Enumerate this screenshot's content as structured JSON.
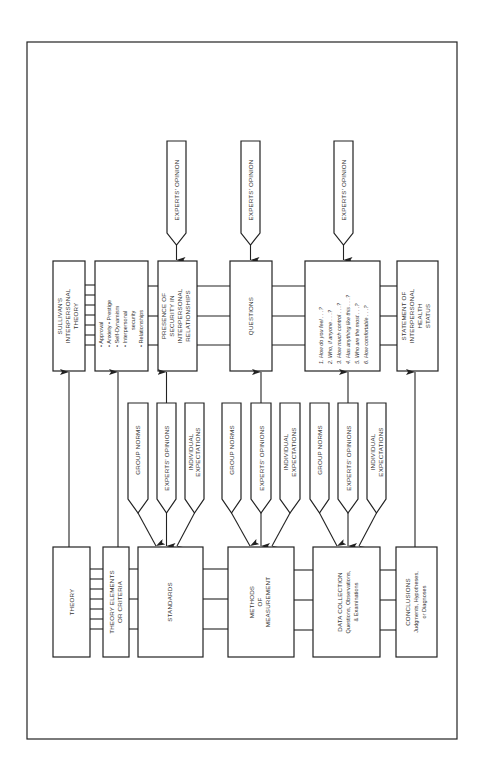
{
  "top_row": {
    "sullivan": [
      "SULLIVAN'S",
      "INTERPERSONAL",
      "THEORY"
    ],
    "bullets": [
      "• Approval",
      "• Anxiety  • Prestige",
      "• Self-Dynamism",
      "• Interpersonal",
      "security",
      "• Relationships"
    ],
    "presence": [
      "PRESENCE OF",
      "SECURITY IN",
      "INTERPERSONAL",
      "RELATIONSHIPS"
    ],
    "questions": "QUESTIONS",
    "question_list": [
      "1.  How do you feel . . .?",
      "2.  Who, if anyone . . .?",
      "3.  How much control . . .?",
      "4.  Has anything like this . . .?",
      "5.  Who are the most . . .?",
      "6.  How comfortable . . .?"
    ],
    "statement": [
      "STATEMENT OF",
      "INTERPERSONAL",
      "HEALTH",
      "STATUS"
    ]
  },
  "experts_opinion_inputs": [
    "EXPERTS' OPINION",
    "EXPERTS' OPINION",
    "EXPERTS' OPINION"
  ],
  "middle_inputs": {
    "group_norms": "GROUP NORMS",
    "experts_opinions": "EXPERTS' OPINIONS",
    "individual_expectations": [
      "INDIVIDUAL",
      "EXPECTATIONS"
    ]
  },
  "bottom_row": {
    "theory": "THEORY",
    "theory_elements": [
      "THEORY ELEMENTS",
      "OR CRITERIA"
    ],
    "standards": "STANDARDS",
    "methods": [
      "METHODS",
      "OF",
      "MEASUREMENT"
    ],
    "data_collection": [
      "DATA COLLECTION",
      "Questions, Observations,",
      "& Examinations"
    ],
    "conclusions": [
      "CONCLUSIONS",
      "Judgments, Hypotheses,",
      "or Diagnoses"
    ]
  }
}
